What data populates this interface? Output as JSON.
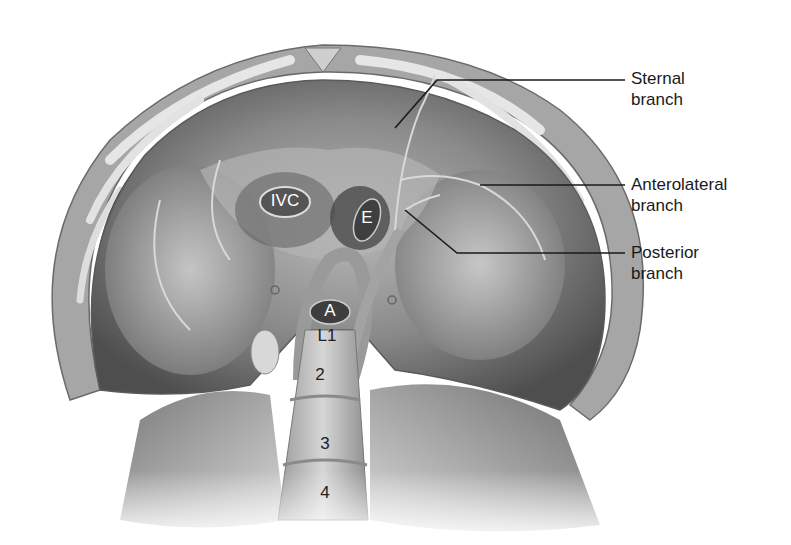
{
  "figure": {
    "callouts": [
      {
        "id": "sternal",
        "line1": "Sternal",
        "line2": "branch"
      },
      {
        "id": "anterolateral",
        "line1": "Anterolateral",
        "line2": "branch"
      },
      {
        "id": "posterior",
        "line1": "Posterior",
        "line2": "branch"
      }
    ],
    "structures": {
      "ivc": "IVC",
      "esophagus": "E",
      "aorta": "A",
      "l1": "L1",
      "l2": "2",
      "l3": "3",
      "l4": "4"
    },
    "colors": {
      "background": "#ffffff",
      "leader_line": "#1a1a1a",
      "tissue_dark": "#4a4a4a",
      "tissue_mid": "#8c8c8c",
      "tissue_light": "#c8c8c8"
    }
  }
}
